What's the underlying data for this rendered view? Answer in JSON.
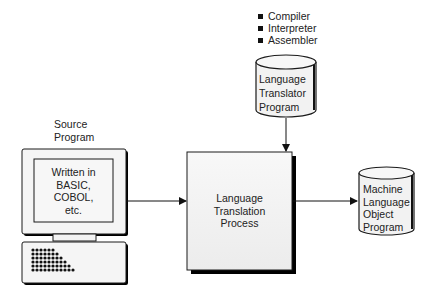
{
  "diagram": {
    "translator_types": [
      "Compiler",
      "Interpreter",
      "Assembler"
    ],
    "source": {
      "label_line1": "Source",
      "label_line2": "Program",
      "screen_lines": [
        "Written in",
        "BASIC,",
        "COBOL,",
        "etc."
      ]
    },
    "translator_program": {
      "lines": [
        "Language",
        "Translator",
        "Program"
      ]
    },
    "process": {
      "lines": [
        "Language",
        "Translation",
        "Process"
      ]
    },
    "output": {
      "lines": [
        "Machine",
        "Language",
        "Object",
        "Program"
      ]
    },
    "colors": {
      "stroke": "#1a1a1a",
      "fill": "#f4f4f4",
      "shadow": "#000000",
      "background": "#ffffff"
    }
  }
}
